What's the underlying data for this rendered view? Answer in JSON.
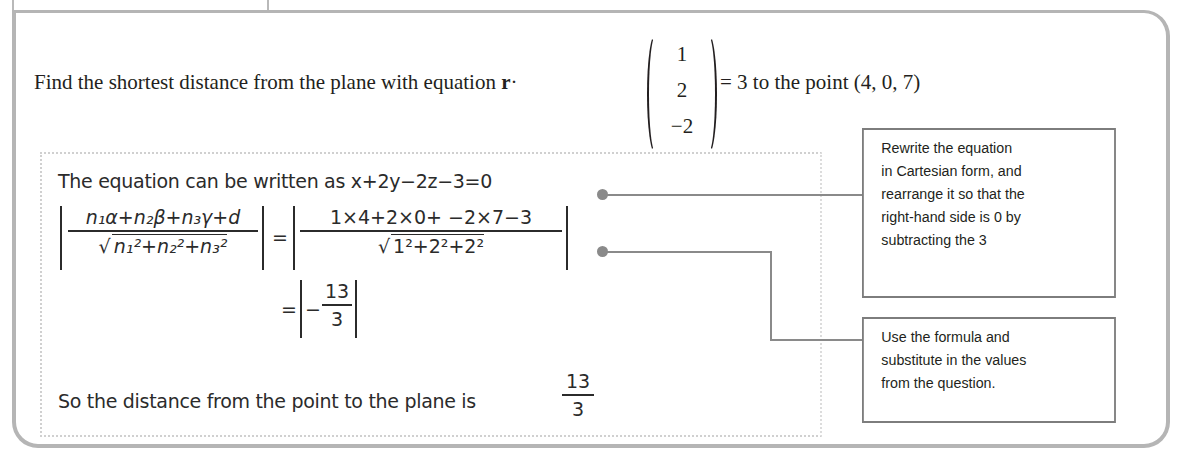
{
  "question": {
    "prefix": "Find the shortest distance from the plane with equation",
    "vector_symbol": "r",
    "dot": "·",
    "normal_vector": [
      "1",
      "2",
      "−2"
    ],
    "suffix_eq": "= 3 to the point (4, 0, 7)"
  },
  "working": {
    "line1_text": "The equation can be written as",
    "line1_eq": "x+2y−2z−3=0",
    "formula_numerator": [
      "n",
      "1",
      "α+",
      "n",
      "2",
      "β+",
      "n",
      "3",
      "γ+",
      "d"
    ],
    "formula_num_text": "n₁α+n₂β+n₃γ+d",
    "formula_den_text": "n₁²+n₂²+n₃²",
    "equals": "=",
    "subst_numerator": "1×4+2×0+ −2×7−3",
    "subst_den_text": "1²+2²+2²",
    "result_equals": "=",
    "result_sign": "−",
    "result_num": "13",
    "result_den": "3",
    "conclusion_text": "So the distance from the point to the plane is",
    "conclusion_num": "13",
    "conclusion_den": "3"
  },
  "callouts": [
    {
      "lines": [
        "Rewrite the equation",
        "in Cartesian form, and",
        "rearrange it so that the",
        "right-hand side is 0 by",
        "subtracting the 3"
      ]
    },
    {
      "lines": [
        "Use the formula and",
        "substitute in the values",
        "from the question."
      ]
    }
  ],
  "colors": {
    "frame": "#b5b5b5",
    "connector": "#8a8a8a",
    "callout_border": "#7d7d7d",
    "text": "#231f20"
  }
}
